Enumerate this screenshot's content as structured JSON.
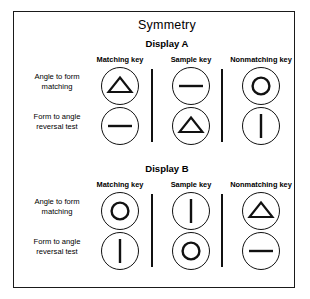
{
  "figure": {
    "title": "Symmetry",
    "displays": [
      {
        "id": "display-a",
        "heading": "Display A",
        "column_headers": [
          "Matching key",
          "Sample key",
          "Nonmatching key"
        ],
        "rows": [
          {
            "label_line1": "Angle to form",
            "label_line2": "matching",
            "keys": [
              "triangle",
              "horizontal-line",
              "circle"
            ]
          },
          {
            "label_line1": "Form to angle",
            "label_line2": "reversal test",
            "keys": [
              "horizontal-line",
              "triangle",
              "vertical-line"
            ]
          }
        ]
      },
      {
        "id": "display-b",
        "heading": "Display B",
        "column_headers": [
          "Matching key",
          "Sample key",
          "Nonmatching key"
        ],
        "rows": [
          {
            "label_line1": "Angle to form",
            "label_line2": "matching",
            "keys": [
              "circle",
              "vertical-line",
              "triangle"
            ]
          },
          {
            "label_line1": "Form to angle",
            "label_line2": "reversal test",
            "keys": [
              "vertical-line",
              "circle",
              "horizontal-line"
            ]
          }
        ]
      }
    ],
    "colors": {
      "ink": "#111111",
      "border": "#1a1a1a",
      "background": "#ffffff"
    }
  }
}
